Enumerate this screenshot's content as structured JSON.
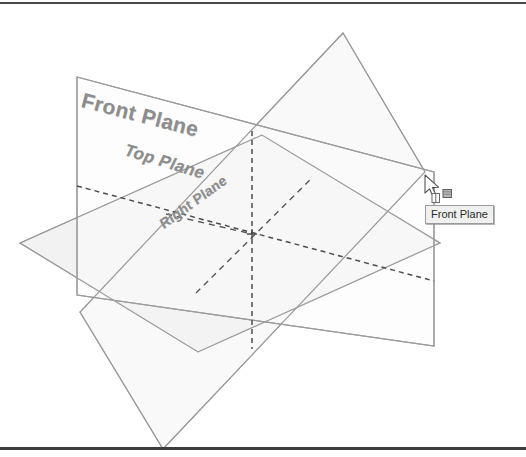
{
  "app": {
    "title": "Reference Planes 3D View",
    "background_color": "#ffffff"
  },
  "viewport": {
    "width": 526,
    "height": 457,
    "frame_line_color": "#4a4a4a"
  },
  "planes": [
    {
      "id": "front-plane",
      "label": "Front Plane",
      "orientation": "vertical-back",
      "fill_color": "#fbfbfb",
      "edge_color": "#9b9b9b",
      "label_rotation_deg": 14.5
    },
    {
      "id": "top-plane",
      "label": "Top Plane",
      "orientation": "horizontal",
      "fill_color": "#f2f2f2",
      "edge_color": "#9b9b9b",
      "label_rotation_deg": 17
    },
    {
      "id": "right-plane",
      "label": "Right Plane",
      "orientation": "vertical-side",
      "fill_color": "#f4f4f4",
      "edge_color": "#9b9b9b",
      "label_rotation_deg": -36
    }
  ],
  "origin": {
    "label": "origin-marker",
    "x": 252,
    "y": 234
  },
  "construction_lines": {
    "style": "dashed",
    "color": "#4d4d4d"
  },
  "cursor": {
    "name": "select-plane-cursor",
    "x": 427,
    "y": 180,
    "badge": "plane-select-badge"
  },
  "tooltip": {
    "text": "Front Plane",
    "x": 425,
    "y": 205,
    "background": "#f0f0f0",
    "border_color": "#9a9a9a"
  }
}
